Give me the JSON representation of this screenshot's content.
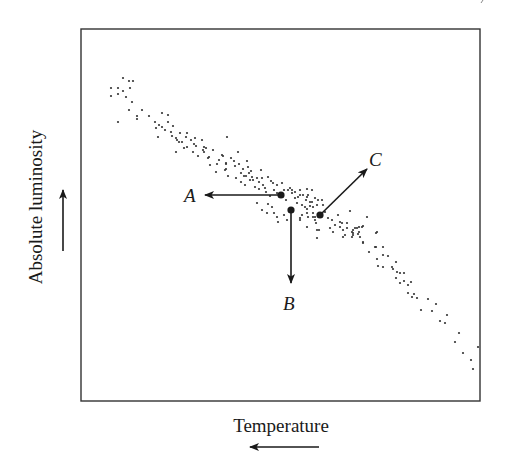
{
  "figure": {
    "x_axis_label": "Temperature",
    "y_axis_label": "Absolute luminosity",
    "x_axis_arrow_direction": "left",
    "y_axis_arrow_direction": "up",
    "colors": {
      "ink": "#1a1a1a",
      "frame": "#333333",
      "dots": "#333333",
      "background": "#ffffff"
    },
    "frame": {
      "x": 81,
      "y": 29,
      "width": 399,
      "height": 372
    },
    "markers": [
      {
        "id": "A",
        "label": "A",
        "dot": [
          281,
          195
        ],
        "arrow_to": [
          205,
          195
        ],
        "label_pos": [
          184,
          202
        ]
      },
      {
        "id": "B",
        "label": "B",
        "dot": [
          291,
          210
        ],
        "arrow_to": [
          291,
          283
        ],
        "label_pos": [
          283,
          310
        ]
      },
      {
        "id": "C",
        "label": "C",
        "dot": [
          320,
          215
        ],
        "arrow_to": [
          367,
          169
        ],
        "label_pos": [
          369,
          166
        ]
      }
    ],
    "scatter_points": [
      [
        123,
        78
      ],
      [
        129,
        81
      ],
      [
        133,
        81
      ],
      [
        111,
        88
      ],
      [
        118,
        88
      ],
      [
        123,
        91
      ],
      [
        130,
        88
      ],
      [
        111,
        96
      ],
      [
        118,
        94
      ],
      [
        126,
        97
      ],
      [
        132,
        102
      ],
      [
        129,
        110
      ],
      [
        142,
        110
      ],
      [
        137,
        116
      ],
      [
        137,
        119
      ],
      [
        149,
        116
      ],
      [
        118,
        122
      ],
      [
        155,
        122
      ],
      [
        159,
        125
      ],
      [
        162,
        127
      ],
      [
        168,
        122
      ],
      [
        173,
        126
      ],
      [
        158,
        137
      ],
      [
        171,
        132
      ],
      [
        172,
        136
      ],
      [
        176,
        138
      ],
      [
        177,
        140
      ],
      [
        179,
        142
      ],
      [
        182,
        142
      ],
      [
        186,
        137
      ],
      [
        187,
        133
      ],
      [
        191,
        140
      ],
      [
        194,
        144
      ],
      [
        202,
        140
      ],
      [
        204,
        147
      ],
      [
        206,
        148
      ],
      [
        227,
        137
      ],
      [
        176,
        152
      ],
      [
        187,
        147
      ],
      [
        193,
        152
      ],
      [
        198,
        156
      ],
      [
        204,
        152
      ],
      [
        208,
        158
      ],
      [
        210,
        165
      ],
      [
        217,
        164
      ],
      [
        223,
        156
      ],
      [
        226,
        164
      ],
      [
        216,
        172
      ],
      [
        225,
        170
      ],
      [
        203,
        150
      ],
      [
        222,
        155
      ],
      [
        209,
        157
      ],
      [
        226,
        163
      ],
      [
        226,
        169
      ],
      [
        234,
        161
      ],
      [
        235,
        166
      ],
      [
        239,
        164
      ],
      [
        241,
        173
      ],
      [
        247,
        161
      ],
      [
        249,
        173
      ],
      [
        250,
        180
      ],
      [
        241,
        182
      ],
      [
        243,
        169
      ],
      [
        248,
        167
      ],
      [
        252,
        177
      ],
      [
        253,
        180
      ],
      [
        257,
        178
      ],
      [
        259,
        182
      ],
      [
        262,
        178
      ],
      [
        261,
        170
      ],
      [
        263,
        185
      ],
      [
        265,
        188
      ],
      [
        255,
        187
      ],
      [
        259,
        189
      ],
      [
        268,
        177
      ],
      [
        271,
        181
      ],
      [
        273,
        183
      ],
      [
        277,
        185
      ],
      [
        274,
        190
      ],
      [
        266,
        192
      ],
      [
        277,
        193
      ],
      [
        284,
        190
      ],
      [
        288,
        190
      ],
      [
        292,
        193
      ],
      [
        300,
        190
      ],
      [
        307,
        189
      ],
      [
        312,
        190
      ],
      [
        290,
        188
      ],
      [
        282,
        183
      ],
      [
        246,
        176
      ],
      [
        251,
        171
      ],
      [
        244,
        176
      ],
      [
        257,
        203
      ],
      [
        268,
        204
      ],
      [
        272,
        207
      ],
      [
        262,
        210
      ],
      [
        267,
        213
      ],
      [
        274,
        213
      ],
      [
        277,
        217
      ],
      [
        278,
        222
      ],
      [
        284,
        215
      ],
      [
        287,
        220
      ],
      [
        297,
        203
      ],
      [
        302,
        205
      ],
      [
        306,
        200
      ],
      [
        307,
        209
      ],
      [
        310,
        206
      ],
      [
        313,
        213
      ],
      [
        315,
        217
      ],
      [
        302,
        215
      ],
      [
        300,
        220
      ],
      [
        307,
        227
      ],
      [
        317,
        230
      ],
      [
        317,
        238
      ],
      [
        300,
        195
      ],
      [
        295,
        198
      ],
      [
        307,
        197
      ],
      [
        312,
        202
      ],
      [
        318,
        200
      ],
      [
        292,
        190
      ],
      [
        295,
        192
      ],
      [
        298,
        197
      ],
      [
        303,
        195
      ],
      [
        308,
        195
      ],
      [
        315,
        198
      ],
      [
        310,
        202
      ],
      [
        313,
        207
      ],
      [
        317,
        205
      ],
      [
        322,
        200
      ],
      [
        323,
        205
      ],
      [
        305,
        207
      ],
      [
        307,
        213
      ],
      [
        300,
        218
      ],
      [
        308,
        217
      ],
      [
        313,
        217
      ],
      [
        315,
        220
      ],
      [
        316,
        223
      ],
      [
        319,
        230
      ],
      [
        332,
        220
      ],
      [
        335,
        225
      ],
      [
        340,
        222
      ],
      [
        340,
        227
      ],
      [
        343,
        230
      ],
      [
        347,
        223
      ],
      [
        350,
        211
      ],
      [
        345,
        235
      ],
      [
        333,
        232
      ],
      [
        330,
        228
      ],
      [
        353,
        230
      ],
      [
        357,
        228
      ],
      [
        359,
        232
      ],
      [
        362,
        227
      ],
      [
        353,
        235
      ],
      [
        360,
        237
      ],
      [
        367,
        217
      ],
      [
        377,
        232
      ],
      [
        363,
        242
      ],
      [
        376,
        247
      ],
      [
        342,
        223
      ],
      [
        347,
        228
      ],
      [
        343,
        237
      ],
      [
        352,
        237
      ],
      [
        352,
        232
      ],
      [
        355,
        228
      ],
      [
        359,
        227
      ],
      [
        363,
        226
      ],
      [
        358,
        234
      ],
      [
        353,
        233
      ],
      [
        376,
        233
      ],
      [
        363,
        243
      ],
      [
        369,
        252
      ],
      [
        375,
        247
      ],
      [
        383,
        247
      ],
      [
        383,
        255
      ],
      [
        377,
        259
      ],
      [
        388,
        256
      ],
      [
        396,
        262
      ],
      [
        378,
        266
      ],
      [
        383,
        267
      ],
      [
        392,
        267
      ],
      [
        393,
        269
      ],
      [
        397,
        272
      ],
      [
        400,
        273
      ],
      [
        404,
        273
      ],
      [
        396,
        278
      ],
      [
        400,
        283
      ],
      [
        404,
        281
      ],
      [
        408,
        285
      ],
      [
        411,
        282
      ],
      [
        408,
        293
      ],
      [
        414,
        294
      ],
      [
        412,
        297
      ],
      [
        417,
        298
      ],
      [
        428,
        299
      ],
      [
        436,
        304
      ],
      [
        421,
        310
      ],
      [
        432,
        311
      ],
      [
        440,
        321
      ],
      [
        447,
        315
      ],
      [
        445,
        323
      ],
      [
        459,
        333
      ],
      [
        455,
        342
      ],
      [
        478,
        347
      ],
      [
        463,
        353
      ],
      [
        471,
        360
      ],
      [
        473,
        369
      ],
      [
        165,
        130
      ],
      [
        180,
        133
      ],
      [
        196,
        146
      ],
      [
        213,
        150
      ],
      [
        231,
        158
      ],
      [
        238,
        152
      ],
      [
        219,
        160
      ],
      [
        228,
        176
      ],
      [
        236,
        178
      ],
      [
        245,
        185
      ],
      [
        270,
        196
      ],
      [
        286,
        200
      ],
      [
        325,
        212
      ],
      [
        328,
        218
      ],
      [
        338,
        215
      ],
      [
        162,
        113
      ],
      [
        168,
        115
      ],
      [
        156,
        128
      ],
      [
        184,
        148
      ],
      [
        195,
        138
      ]
    ]
  }
}
